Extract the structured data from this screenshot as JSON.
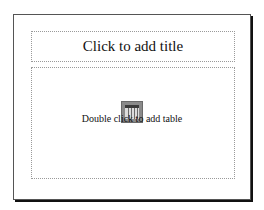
{
  "slide": {
    "title_placeholder": "Click to add title",
    "body_placeholder": "Double click to add table",
    "body_icon": "table-icon"
  }
}
